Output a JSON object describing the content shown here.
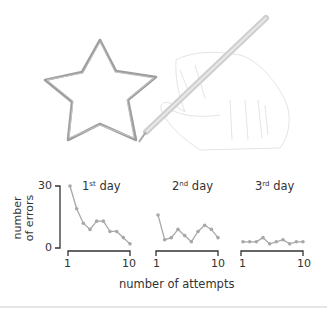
{
  "chart_data": [
    {
      "type": "line",
      "title": "1st day",
      "title_base": "1",
      "title_sup": "st",
      "title_rest": " day",
      "x": [
        1,
        2,
        3,
        4,
        5,
        6,
        7,
        8,
        9,
        10
      ],
      "values": [
        30,
        19,
        12,
        9,
        13,
        13,
        8,
        8,
        5,
        2
      ],
      "xlabel": "number of attempts",
      "ylabel": "number of errors",
      "xticks": [
        "1",
        "10"
      ],
      "yticks": [
        "0",
        "30"
      ],
      "ylim": [
        0,
        30
      ],
      "grid": false
    },
    {
      "type": "line",
      "title": "2nd day",
      "title_base": "2",
      "title_sup": "nd",
      "title_rest": " day",
      "x": [
        1,
        2,
        3,
        4,
        5,
        6,
        7,
        8,
        9,
        10
      ],
      "values": [
        16,
        4,
        5,
        9,
        6,
        3,
        8,
        11,
        9,
        5
      ],
      "xticks": [
        "1",
        "10"
      ],
      "ylim": [
        0,
        30
      ],
      "grid": false
    },
    {
      "type": "line",
      "title": "3rd day",
      "title_base": "3",
      "title_sup": "rd",
      "title_rest": " day",
      "x": [
        1,
        2,
        3,
        4,
        5,
        6,
        7,
        8,
        9,
        10
      ],
      "values": [
        3,
        3,
        3,
        5,
        2,
        3,
        4,
        2,
        3,
        3
      ],
      "xticks": [
        "1",
        "10"
      ],
      "ylim": [
        0,
        30
      ],
      "grid": false
    }
  ],
  "labels": {
    "ylabel_line1": "number",
    "ylabel_line2": "of errors",
    "xlabel": "number of attempts",
    "ytick_top": "30",
    "ytick_bottom": "0",
    "day1": {
      "base": "1",
      "sup": "st",
      "rest": " day",
      "tick_start": "1",
      "tick_end": "10"
    },
    "day2": {
      "base": "2",
      "sup": "nd",
      "rest": " day",
      "tick_start": "1",
      "tick_end": "10"
    },
    "day3": {
      "base": "3",
      "sup": "rd",
      "rest": " day",
      "tick_start": "1",
      "tick_end": "10"
    }
  },
  "illustration": {
    "description": "hand drawing a star with a pencil"
  },
  "colors": {
    "line": "#a8a8a8",
    "axis": "#333333",
    "star_stroke": "#9a9a9a",
    "pencil": "#c8c8c8",
    "hand_outline": "#e2e2e2"
  }
}
